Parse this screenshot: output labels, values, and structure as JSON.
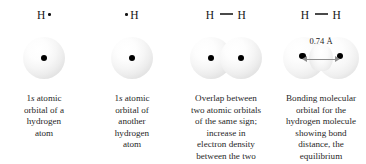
{
  "figure": {
    "background_color": "#ffffff",
    "nucleus_color": "#000000",
    "arrow_color": "#8e8e8e",
    "text_color": "#1f1f1f"
  },
  "panels": [
    {
      "id": "panel-1",
      "formula": {
        "atom": "H",
        "dot_position": "right",
        "bond": false,
        "text": "H·"
      },
      "orbital": {
        "type": "single-sphere",
        "count": 1,
        "nuclei": 1
      },
      "caption_lines": [
        "1s atomic",
        "orbital of a",
        "hydrogen",
        "atom"
      ],
      "caption_text": "1s atomic orbital of a hydrogen atom",
      "italic_token": "s"
    },
    {
      "id": "panel-2",
      "formula": {
        "atom": "H",
        "dot_position": "left",
        "bond": false,
        "text": "·H"
      },
      "orbital": {
        "type": "single-sphere",
        "count": 1,
        "nuclei": 1
      },
      "caption_lines": [
        "1s atomic",
        "orbital of",
        "another",
        "hydrogen",
        "atom"
      ],
      "caption_text": "1s atomic orbital of another hydrogen atom",
      "italic_token": "s"
    },
    {
      "id": "panel-3",
      "formula": {
        "atom_left": "H",
        "atom_right": "H",
        "bond": true,
        "text": "H — H"
      },
      "orbital": {
        "type": "overlapping-spheres",
        "count": 2,
        "nuclei": 2
      },
      "caption_lines": [
        "Overlap between",
        "two atomic orbitals",
        "of the same sign;",
        "increase in",
        "electron density",
        "between the two"
      ],
      "caption_text": "Overlap between two atomic orbitals of the same sign; increase in electron density between the two"
    },
    {
      "id": "panel-4",
      "formula": {
        "atom_left": "H",
        "atom_right": "H",
        "bond": true,
        "text": "H — H"
      },
      "orbital": {
        "type": "bonding-molecular-orbital",
        "count": 1,
        "nuclei": 2,
        "bond_distance_label": "0.74 Å",
        "bond_distance_value": 0.74,
        "bond_distance_unit": "Å"
      },
      "caption_lines": [
        "Bonding molecular",
        "orbital for the",
        "hydrogen molecule",
        "showing bond",
        "distance, the",
        "equilibrium"
      ],
      "caption_text": "Bonding molecular orbital for the hydrogen molecule showing bond distance, the equilibrium"
    }
  ]
}
